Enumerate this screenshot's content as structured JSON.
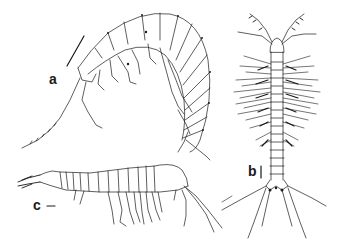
{
  "figure": {
    "panels": [
      {
        "id": "a",
        "label": "a",
        "description": "amphipod, lateral view, curved body",
        "scale_bar": "diagonal"
      },
      {
        "id": "b",
        "label": "b",
        "description": "elongate crustacean, dorsal view with setose appendages",
        "scale_bar": "vertical"
      },
      {
        "id": "c",
        "label": "c",
        "description": "mysid-like crustacean, lateral view",
        "scale_bar": "horizontal"
      }
    ],
    "colors": {
      "ink": "#1a1a1a",
      "background": "#ffffff"
    }
  }
}
